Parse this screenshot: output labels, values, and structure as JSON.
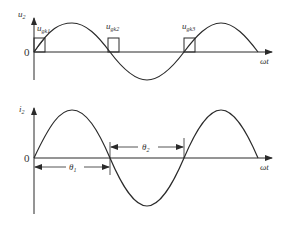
{
  "top_panel": {
    "y_label": "u",
    "y_label_sub": "2",
    "x_label": "ωt",
    "origin_label": "0",
    "pulses": [
      {
        "label": "u",
        "sub": "gk1"
      },
      {
        "label": "u",
        "sub": "gk2"
      },
      {
        "label": "u",
        "sub": "gk3"
      }
    ]
  },
  "bottom_panel": {
    "y_label": "i",
    "y_label_sub": "2",
    "x_label": "ωt",
    "origin_label": "0",
    "angles": [
      {
        "label": "θ",
        "sub": "1"
      },
      {
        "label": "θ",
        "sub": "2"
      }
    ]
  },
  "colors": {
    "stroke": "#2a2a2a",
    "text": "#333333"
  }
}
